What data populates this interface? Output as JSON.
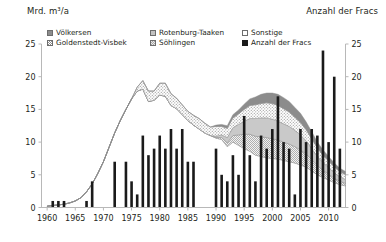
{
  "titles": {
    "left_axis": "Mrd. m³/a",
    "right_axis": "Anzahl der Fracs"
  },
  "legend": {
    "items": [
      {
        "label": "Völkersen",
        "swatch": "voelkersen-swatch",
        "pattern": "solid-gray"
      },
      {
        "label": "Rotenburg-Taaken",
        "swatch": "rotenburg-swatch",
        "pattern": "light-gray"
      },
      {
        "label": "Sonstige",
        "swatch": "sonstige-swatch",
        "pattern": "white"
      },
      {
        "label": "Goldenstedt-Visbek",
        "swatch": "goldenstedt-swatch",
        "pattern": "checker-dark"
      },
      {
        "label": "Söhlingen",
        "swatch": "soehlingen-swatch",
        "pattern": "checker-light"
      },
      {
        "label": "Anzahl der Fracs",
        "swatch": "fracs-swatch",
        "pattern": "black"
      }
    ]
  },
  "colors": {
    "voelkersen": "#8c8c8c",
    "rotenburg": "#c2c2c2",
    "sonstige": "#ffffff",
    "goldenstedt": "#8f8f8f",
    "soehlingen": "#a8a8a8",
    "fracs": "#1a1a1a",
    "axis": "#b8b8b8",
    "text": "#231f20"
  },
  "chart_data": {
    "type": "area",
    "title": "",
    "subtitle": "",
    "xlabel": "",
    "ylabel": "Mrd. m³/a",
    "y2label": "Anzahl der Fracs",
    "grid": false,
    "legend_position": "top",
    "xlim": [
      1959,
      2013
    ],
    "ylim": [
      0,
      25
    ],
    "y2lim": [
      0,
      25
    ],
    "yticks": [
      0,
      5,
      10,
      15,
      20,
      25
    ],
    "y2ticks": [
      0,
      5,
      10,
      15,
      20,
      25
    ],
    "xticks": [
      1960,
      1965,
      1970,
      1975,
      1980,
      1985,
      1990,
      1995,
      2000,
      2005,
      2010
    ],
    "x": [
      1960,
      1961,
      1962,
      1963,
      1964,
      1965,
      1966,
      1967,
      1968,
      1969,
      1970,
      1971,
      1972,
      1973,
      1974,
      1975,
      1976,
      1977,
      1978,
      1979,
      1980,
      1981,
      1982,
      1983,
      1984,
      1985,
      1986,
      1987,
      1988,
      1989,
      1990,
      1991,
      1992,
      1993,
      1994,
      1995,
      1996,
      1997,
      1998,
      1999,
      2000,
      2001,
      2002,
      2003,
      2004,
      2005,
      2006,
      2007,
      2008,
      2009,
      2010,
      2011,
      2012,
      2013
    ],
    "series": [
      {
        "name": "Sonstige",
        "stack_order": 1,
        "values": [
          0.2,
          0.3,
          0.4,
          0.5,
          0.7,
          1.0,
          1.5,
          2.4,
          3.6,
          5.2,
          7.0,
          9.2,
          11.4,
          13.3,
          15.0,
          16.6,
          17.8,
          18.1,
          16.2,
          16.4,
          17.2,
          17.0,
          15.6,
          15.1,
          14.2,
          13.3,
          12.6,
          12.0,
          11.4,
          11.0,
          10.6,
          10.4,
          9.3,
          10.0,
          9.5,
          9.0,
          8.6,
          8.0,
          7.8,
          7.6,
          7.5,
          7.4,
          7.2,
          7.0,
          6.8,
          6.5,
          6.2,
          5.6,
          5.0,
          4.6,
          4.2,
          3.8,
          3.5,
          3.3
        ]
      },
      {
        "name": "Söhlingen",
        "stack_order": 2,
        "values": [
          0,
          0,
          0,
          0,
          0,
          0,
          0,
          0,
          0,
          0,
          0,
          0,
          0,
          0,
          0,
          0,
          0,
          0,
          0,
          0,
          0,
          0,
          0,
          0,
          0,
          0,
          0,
          0,
          0,
          0,
          0.1,
          0.3,
          0.6,
          1.0,
          1.6,
          2.2,
          2.6,
          2.9,
          3.0,
          3.1,
          3.0,
          2.9,
          2.8,
          2.7,
          2.5,
          2.3,
          2.0,
          1.7,
          1.4,
          1.1,
          0.9,
          0.7,
          0.5,
          0.4
        ]
      },
      {
        "name": "Rotenburg-Taaken",
        "stack_order": 3,
        "values": [
          0,
          0,
          0,
          0,
          0,
          0,
          0,
          0,
          0,
          0,
          0,
          0,
          0,
          0,
          0,
          0,
          0,
          0,
          0,
          0,
          0,
          0,
          0,
          0,
          0,
          0,
          0,
          0,
          0,
          0,
          0.2,
          0.4,
          0.8,
          1.2,
          1.6,
          2.0,
          2.4,
          2.7,
          2.9,
          3.0,
          3.0,
          2.9,
          2.8,
          2.7,
          2.5,
          2.3,
          2.0,
          1.7,
          1.4,
          1.2,
          1.0,
          0.8,
          0.7,
          0.6
        ]
      },
      {
        "name": "Goldenstedt-Visbek",
        "stack_order": 4,
        "values": [
          0,
          0,
          0,
          0,
          0,
          0,
          0,
          0,
          0,
          0,
          0,
          0,
          0,
          0,
          0,
          0,
          0.6,
          1.3,
          1.6,
          1.4,
          1.8,
          2.0,
          1.8,
          1.6,
          1.5,
          1.4,
          1.5,
          1.6,
          1.5,
          1.3,
          1.5,
          1.3,
          1.4,
          1.5,
          1.6,
          1.8,
          2.0,
          2.1,
          2.2,
          2.3,
          2.4,
          2.4,
          2.3,
          2.2,
          2.0,
          1.9,
          1.7,
          1.5,
          1.3,
          1.1,
          1.0,
          0.9,
          0.8,
          0.7
        ]
      },
      {
        "name": "Völkersen",
        "stack_order": 5,
        "values": [
          0,
          0,
          0,
          0,
          0,
          0,
          0,
          0,
          0,
          0,
          0,
          0,
          0,
          0,
          0,
          0,
          0,
          0,
          0,
          0,
          0,
          0,
          0,
          0,
          0,
          0,
          0,
          0,
          0,
          0,
          0.2,
          0.3,
          0.4,
          0.5,
          0.6,
          0.8,
          1.0,
          1.2,
          1.4,
          1.5,
          1.6,
          1.7,
          1.7,
          1.6,
          1.5,
          1.4,
          1.2,
          1.1,
          0.9,
          0.8,
          0.7,
          0.6,
          0.5,
          0.5
        ]
      }
    ],
    "bars": {
      "name": "Anzahl der Fracs",
      "axis": "right",
      "values": [
        0,
        1,
        1,
        1,
        0,
        0,
        0,
        0,
        1,
        4,
        0,
        0,
        0,
        0,
        0,
        0,
        0,
        0,
        0,
        0,
        0,
        0,
        0,
        0,
        0,
        0,
        0,
        0,
        0,
        0,
        0,
        0,
        0,
        0,
        0,
        0,
        0,
        0,
        0,
        0,
        0,
        0,
        0,
        0,
        0,
        0,
        0,
        0,
        0,
        0,
        0,
        0,
        0,
        0
      ],
      "values_by_year": {
        "1960": 0,
        "1961": 1,
        "1962": 1,
        "1963": 1,
        "1964": 0,
        "1965": 0,
        "1966": 0,
        "1967": 1,
        "1968": 4,
        "1969": 0,
        "1970": 0,
        "1971": 0,
        "1972": 7,
        "1973": 0,
        "1974": 7,
        "1975": 4,
        "1976": 2,
        "1977": 11,
        "1978": 8,
        "1979": 9,
        "1980": 11,
        "1981": 9,
        "1982": 12,
        "1983": 9,
        "1984": 12,
        "1985": 7,
        "1986": 7,
        "1987": 0,
        "1988": 0,
        "1989": 0,
        "1990": 9,
        "1991": 5,
        "1992": 4,
        "1993": 8,
        "1994": 5,
        "1995": 14,
        "1996": 8,
        "1997": 4,
        "1998": 11,
        "1999": 9,
        "2000": 12,
        "2001": 17,
        "2002": 10,
        "2003": 9,
        "2004": 2,
        "2005": 12,
        "2006": 10,
        "2007": 12,
        "2008": 11,
        "2009": 24,
        "2010": 10,
        "2011": 20,
        "2012": 9,
        "2013": 0
      }
    }
  }
}
